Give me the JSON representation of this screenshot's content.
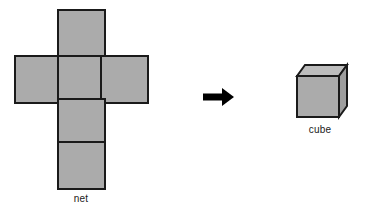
{
  "figure": {
    "title": "",
    "background_color": "#ffffff",
    "face_fill_color": "#ababab",
    "top_face_fill_color": "#bdbdbd",
    "side_face_fill_color": "#a0a0a0",
    "outline_color": "#1a1a1a",
    "arrow_color": "#000000",
    "label_color": "#1a1a1a",
    "stroke_width": 2
  },
  "net": {
    "label": "net",
    "square_count": 6,
    "square_size": 47,
    "squares": [
      {
        "name": "top",
        "x": 58,
        "y": 10
      },
      {
        "name": "middle-left",
        "x": 15,
        "y": 56
      },
      {
        "name": "middle-center",
        "x": 58,
        "y": 56
      },
      {
        "name": "middle-right",
        "x": 101,
        "y": 56
      },
      {
        "name": "lower-center",
        "x": 58,
        "y": 99
      },
      {
        "name": "bottom-center",
        "x": 58,
        "y": 142
      }
    ]
  },
  "arrow": {
    "name": "right-arrow",
    "x1": 203,
    "y1": 97,
    "x2": 234,
    "y2": 97
  },
  "cube": {
    "label": "cube",
    "front_face": {
      "x": 297,
      "y": 76,
      "width": 42,
      "height": 41
    },
    "top_face_offset_x": 8,
    "top_face_offset_y": 11
  }
}
